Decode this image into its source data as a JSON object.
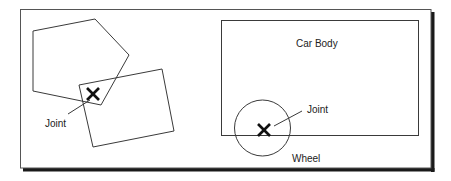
{
  "diagram": {
    "left_example": {
      "description": "Two rigid bodies (pentagon and rectangle) connected by a joint",
      "joint_marker": "X",
      "joint_label": "Joint"
    },
    "right_example": {
      "description": "Car body with wheel attached by a joint",
      "body_label": "Car Body",
      "joint_marker": "X",
      "joint_label": "Joint",
      "wheel_label": "Wheel"
    },
    "colors": {
      "stroke": "#3a3a3a",
      "marker": "#111111",
      "shadow": "#1a1a1a",
      "background": "#ffffff"
    }
  }
}
